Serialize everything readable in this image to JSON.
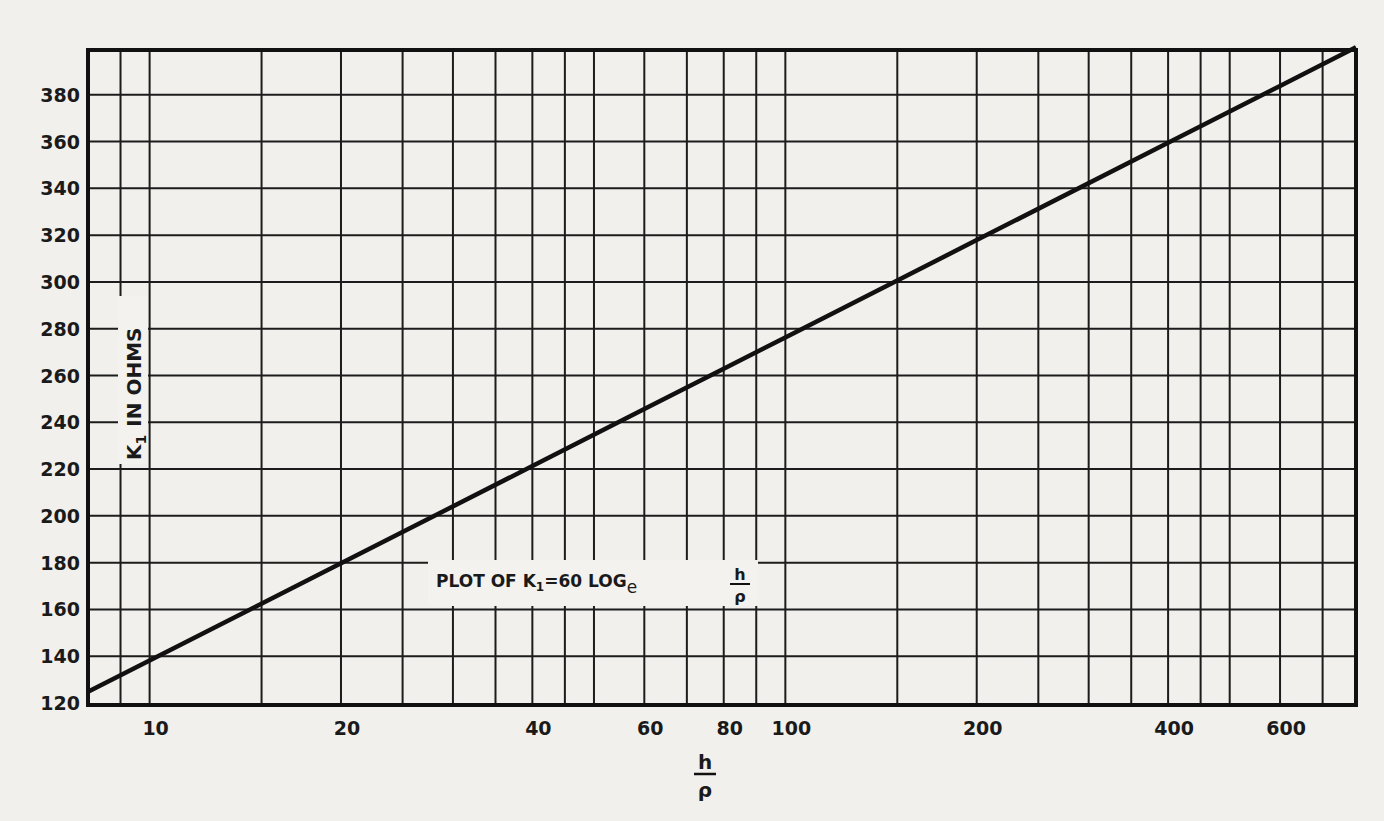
{
  "chart_data": {
    "type": "line",
    "annotation": {
      "prefix": "PLOT OF K",
      "subscript": "1",
      "equals": "=60 LOG",
      "log_base": "e",
      "frac_num": "h",
      "frac_den": "ρ"
    },
    "xlabel": {
      "num": "h",
      "den": "ρ"
    },
    "ylabel": "K₁ IN OHMS",
    "ylabel_parts": {
      "k": "K",
      "sub": "1",
      "rest": "IN OHMS"
    },
    "xscale": "log",
    "yscale": "linear",
    "xlim": [
      8,
      790
    ],
    "ylim": [
      120,
      400
    ],
    "grid": true,
    "legend": null,
    "xticks": [
      10,
      20,
      40,
      60,
      80,
      100,
      200,
      400,
      600
    ],
    "xtick_labels": [
      "10",
      "20",
      "40",
      "60",
      "80",
      "100",
      "200",
      "400",
      "600"
    ],
    "yticks": [
      120,
      140,
      160,
      180,
      200,
      220,
      240,
      260,
      280,
      300,
      320,
      340,
      360,
      380
    ],
    "ytick_labels": [
      "120",
      "140",
      "160",
      "180",
      "200",
      "220",
      "240",
      "260",
      "280",
      "300",
      "320",
      "340",
      "360",
      "380"
    ],
    "series": [
      {
        "name": "K1 = 60 ln(h/ρ)",
        "x": [
          8,
          10,
          20,
          40,
          60,
          80,
          100,
          200,
          400,
          600,
          790
        ],
        "y": [
          124.8,
          138.2,
          179.7,
          221.3,
          245.7,
          262.9,
          276.3,
          317.9,
          359.5,
          383.8,
          400.3
        ]
      }
    ]
  }
}
